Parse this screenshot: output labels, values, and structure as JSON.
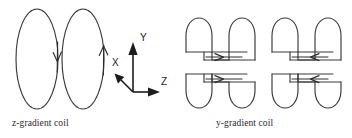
{
  "figure": {
    "background": "#ffffff",
    "stroke_color": "#3a3a3a",
    "axis_color": "#1c1c1c"
  },
  "captions": {
    "z_gradient": "z-gradient coil",
    "y_gradient": "y-gradient coil"
  },
  "axes": {
    "origin": [
      133,
      92
    ],
    "labels": {
      "x": "X",
      "y": "Y",
      "z": "Z"
    },
    "directions": {
      "x": "down-left",
      "y": "up",
      "z": "right"
    }
  },
  "z_gradient_coil": {
    "type": "maxwell-pair",
    "loops": [
      {
        "name": "left-ring",
        "center": [
          37,
          59
        ],
        "rx": 21,
        "ry": 50,
        "current_direction": "down"
      },
      {
        "name": "right-ring",
        "center": [
          83,
          59
        ],
        "rx": 21,
        "ry": 50,
        "current_direction": "up"
      }
    ]
  },
  "y_gradient_coil": {
    "type": "saddle-coil-set",
    "saddles": [
      {
        "name": "top-left-saddle",
        "orientation": "arches-up",
        "current_direction": "right"
      },
      {
        "name": "top-right-saddle",
        "orientation": "arches-up",
        "current_direction": "left"
      },
      {
        "name": "bottom-left-saddle",
        "orientation": "arches-down",
        "current_direction": "right"
      },
      {
        "name": "bottom-right-saddle",
        "orientation": "arches-down",
        "current_direction": "left"
      }
    ]
  }
}
